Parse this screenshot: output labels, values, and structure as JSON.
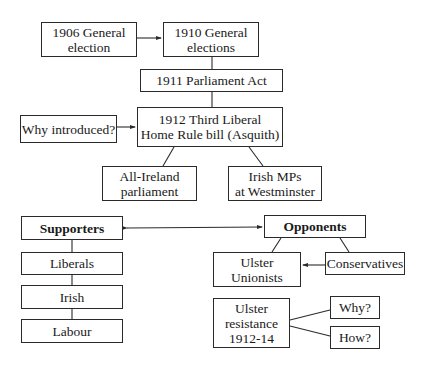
{
  "diagram": {
    "nodes": {
      "election_1906": "1906 General\nelection",
      "election_1910": "1910 General\nelections",
      "parliament_act_1911": "1911 Parliament Act",
      "why_introduced": "Why introduced?",
      "home_rule_bill_1912": "1912 Third Liberal\nHome Rule bill (Asquith)",
      "all_ireland_parliament": "All-Ireland\nparliament",
      "irish_mps": "Irish MPs\nat Westminster",
      "supporters": "Supporters",
      "liberals": "Liberals",
      "irish": "Irish",
      "labour": "Labour",
      "opponents": "Opponents",
      "ulster_unionists": "Ulster\nUnionists",
      "conservatives": "Conservatives",
      "ulster_resistance": "Ulster\nresistance\n1912-14",
      "why": "Why?",
      "how": "How?"
    },
    "edges": [
      {
        "from": "election_1906",
        "to": "election_1910",
        "type": "arrow"
      },
      {
        "from": "election_1910",
        "to": "parliament_act_1911",
        "type": "line"
      },
      {
        "from": "parliament_act_1911",
        "to": "home_rule_bill_1912",
        "type": "line"
      },
      {
        "from": "why_introduced",
        "to": "home_rule_bill_1912",
        "type": "arrow"
      },
      {
        "from": "home_rule_bill_1912",
        "to": "all_ireland_parliament",
        "type": "line"
      },
      {
        "from": "home_rule_bill_1912",
        "to": "irish_mps",
        "type": "line"
      },
      {
        "from": "supporters",
        "to": "opponents",
        "type": "double-arrow"
      },
      {
        "from": "supporters",
        "to": "liberals",
        "type": "line"
      },
      {
        "from": "liberals",
        "to": "irish",
        "type": "line"
      },
      {
        "from": "irish",
        "to": "labour",
        "type": "line"
      },
      {
        "from": "opponents",
        "to": "ulster_unionists",
        "type": "line"
      },
      {
        "from": "opponents",
        "to": "conservatives",
        "type": "line"
      },
      {
        "from": "conservatives",
        "to": "ulster_unionists",
        "type": "arrow"
      },
      {
        "from": "ulster_resistance",
        "to": "why",
        "type": "line"
      },
      {
        "from": "ulster_resistance",
        "to": "how",
        "type": "line"
      }
    ]
  }
}
